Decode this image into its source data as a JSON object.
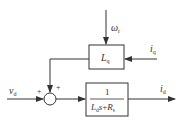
{
  "diagram": {
    "type": "block-diagram",
    "inputs": {
      "omega": {
        "symbol": "ω",
        "sub": "r"
      },
      "iq": {
        "symbol": "i",
        "sub": "q"
      },
      "vd": {
        "symbol": "v",
        "sub": "d"
      }
    },
    "blocks": {
      "lq": {
        "symbol": "L",
        "sub": "q"
      },
      "tf": {
        "numerator": "1",
        "den_L": "L",
        "den_L_sub": "d",
        "den_s": "s",
        "den_plus": "+",
        "den_R": "R",
        "den_R_sub": "s"
      }
    },
    "summing_junction": {
      "sign_left": "+",
      "sign_top": "+"
    },
    "output": {
      "symbol": "i",
      "sub": "d"
    }
  }
}
